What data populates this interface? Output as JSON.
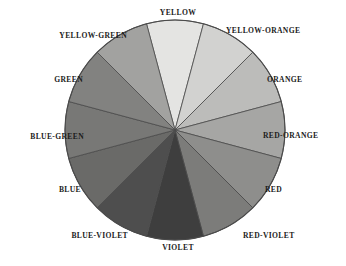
{
  "figure": {
    "background_color": "#ffffff",
    "outline_color": "#4a4a4a"
  },
  "chart_data": {
    "type": "pie",
    "xlabel": "",
    "ylabel": "",
    "legend_position": "outside-radial",
    "grid": false,
    "note": "Twelve equal segments of 30 degrees each, rendered in grayscale. YELLOW is centered at the top (12 o'clock) and hues progress clockwise.",
    "segment_count": 12,
    "segment_degrees": 30,
    "center": {
      "x": 175,
      "y": 130
    },
    "radius": 110,
    "categories": [
      "YELLOW",
      "YELLOW-ORANGE",
      "ORANGE",
      "RED-ORANGE",
      "RED",
      "RED-VIOLET",
      "VIOLET",
      "BLUE-VIOLET",
      "BLUE",
      "BLUE-GREEN",
      "GREEN",
      "YELLOW-GREEN"
    ],
    "values": [
      1,
      1,
      1,
      1,
      1,
      1,
      1,
      1,
      1,
      1,
      1,
      1
    ],
    "colors": [
      "#e4e4e2",
      "#d2d2d0",
      "#bcbcba",
      "#a6a6a4",
      "#8e8e8c",
      "#7c7c7a",
      "#3e3e3e",
      "#4e4e4e",
      "#6a6a68",
      "#787876",
      "#828280",
      "#a2a2a0"
    ],
    "segments": [
      {
        "label": "YELLOW",
        "start_deg": -15,
        "end_deg": 15,
        "color": "#e4e4e2",
        "label_x": 178,
        "label_y": 13,
        "align": "center"
      },
      {
        "label": "YELLOW-ORANGE",
        "start_deg": 15,
        "end_deg": 45,
        "color": "#d2d2d0",
        "label_x": 226,
        "label_y": 31,
        "align": "left"
      },
      {
        "label": "ORANGE",
        "start_deg": 45,
        "end_deg": 75,
        "color": "#bcbcba",
        "label_x": 267,
        "label_y": 80,
        "align": "left"
      },
      {
        "label": "RED-ORANGE",
        "start_deg": 75,
        "end_deg": 105,
        "color": "#a6a6a4",
        "label_x": 263,
        "label_y": 136,
        "align": "left"
      },
      {
        "label": "RED",
        "start_deg": 105,
        "end_deg": 135,
        "color": "#8e8e8c",
        "label_x": 265,
        "label_y": 190,
        "align": "left"
      },
      {
        "label": "RED-VIOLET",
        "start_deg": 135,
        "end_deg": 165,
        "color": "#7c7c7a",
        "label_x": 243,
        "label_y": 236,
        "align": "left"
      },
      {
        "label": "VIOLET",
        "start_deg": 165,
        "end_deg": 195,
        "color": "#3e3e3e",
        "label_x": 178,
        "label_y": 248,
        "align": "center"
      },
      {
        "label": "BLUE-VIOLET",
        "start_deg": 195,
        "end_deg": 225,
        "color": "#4e4e4e",
        "label_x": 128,
        "label_y": 236,
        "align": "right"
      },
      {
        "label": "BLUE",
        "start_deg": 225,
        "end_deg": 255,
        "color": "#6a6a68",
        "label_x": 81,
        "label_y": 190,
        "align": "right"
      },
      {
        "label": "BLUE-GREEN",
        "start_deg": 255,
        "end_deg": 285,
        "color": "#787876",
        "label_x": 84,
        "label_y": 137,
        "align": "right"
      },
      {
        "label": "GREEN",
        "start_deg": 285,
        "end_deg": 315,
        "color": "#828280",
        "label_x": 83,
        "label_y": 80,
        "align": "right"
      },
      {
        "label": "YELLOW-GREEN",
        "start_deg": 315,
        "end_deg": 345,
        "color": "#a2a2a0",
        "label_x": 127,
        "label_y": 36,
        "align": "right"
      }
    ]
  }
}
